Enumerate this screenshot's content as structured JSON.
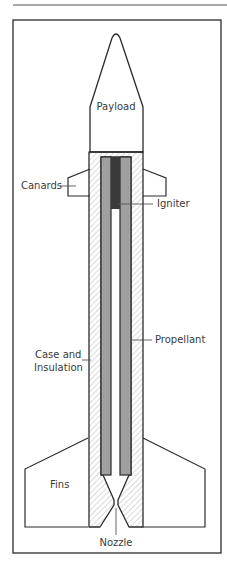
{
  "figure": {
    "type": "labeled cross-section diagram",
    "labels": {
      "payload": "Payload",
      "canards": "Canards",
      "igniter": "Igniter",
      "propellant": "Propellant",
      "case_line1": "Case and",
      "case_line2": "Insulation",
      "fins": "Fins",
      "nozzle": "Nozzle"
    },
    "colors": {
      "outline": "#2b2b2b",
      "propellant": "#a0a0a0",
      "igniter": "#3a3a3a",
      "hatch": "#b5b5b5",
      "background": "#ffffff"
    }
  }
}
